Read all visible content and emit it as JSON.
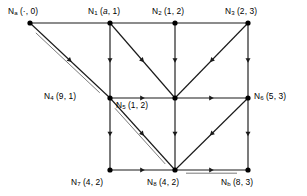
{
  "figure": {
    "type": "directed-graph",
    "background": "#ffffff",
    "stroke_color": "#1a1a1a",
    "node_color": "#000000",
    "width": 307,
    "height": 196
  },
  "nodes": [
    {
      "id": "Na",
      "name": "N",
      "sub": "a",
      "sub_italic": false,
      "tuple": "(·, 0)",
      "label": "Nₐ (·, 0)",
      "x": 30,
      "y": 23,
      "label_x": 8,
      "label_y": 7,
      "label_anchor": "above"
    },
    {
      "id": "N1",
      "name": "N",
      "sub": "1",
      "sub_italic": false,
      "tuple": "(a, 1)",
      "label": "N₁ (a, 1)",
      "x": 110,
      "y": 23,
      "label_x": 88,
      "label_y": 7,
      "label_anchor": "above"
    },
    {
      "id": "N2",
      "name": "N",
      "sub": "2",
      "sub_italic": false,
      "tuple": "(1, 2)",
      "label": "N₂ (1, 2)",
      "x": 175,
      "y": 23,
      "label_x": 153,
      "label_y": 7,
      "label_anchor": "above"
    },
    {
      "id": "N3",
      "name": "N",
      "sub": "3",
      "sub_italic": false,
      "tuple": "(2, 3)",
      "label": "N₃ (2, 3)",
      "x": 248,
      "y": 23,
      "label_x": 226,
      "label_y": 7,
      "label_anchor": "above"
    },
    {
      "id": "N4",
      "name": "N",
      "sub": "4",
      "sub_italic": false,
      "tuple": "(9, 1)",
      "label": "N₄ (9, 1)",
      "x": 110,
      "y": 98,
      "label_x": 44,
      "label_y": 92,
      "label_anchor": "left"
    },
    {
      "id": "N5",
      "name": "N",
      "sub": "5",
      "sub_italic": false,
      "tuple": "(1, 2)",
      "label": "N₅ (1, 2)",
      "x": 175,
      "y": 98,
      "label_x": 116,
      "label_y": 100,
      "label_anchor": "below-left"
    },
    {
      "id": "N6",
      "name": "N",
      "sub": "6",
      "sub_italic": false,
      "tuple": "(5, 3)",
      "label": "N₆ (5, 3)",
      "x": 248,
      "y": 98,
      "label_x": 254,
      "label_y": 92,
      "label_anchor": "right"
    },
    {
      "id": "N7",
      "name": "N",
      "sub": "7",
      "sub_italic": false,
      "tuple": "(4, 2)",
      "label": "N₇ (4, 2)",
      "x": 110,
      "y": 170,
      "label_x": 72,
      "label_y": 178,
      "label_anchor": "below"
    },
    {
      "id": "N8",
      "name": "N",
      "sub": "8",
      "sub_italic": false,
      "tuple": "(4, 2)",
      "label": "N₈ (4, 2)",
      "x": 175,
      "y": 170,
      "label_x": 148,
      "label_y": 178,
      "label_anchor": "below"
    },
    {
      "id": "Nb",
      "name": "N",
      "sub": "b",
      "sub_italic": false,
      "tuple": "(8, 3)",
      "label": "Nᵇ (8, 3)",
      "x": 248,
      "y": 170,
      "label_x": 222,
      "label_y": 178,
      "label_anchor": "below"
    }
  ],
  "edges": [
    {
      "id": "e-na-n1",
      "from": "Na",
      "to": "N1",
      "style": "single",
      "arrow": "none",
      "note": "top row segment Na to N1"
    },
    {
      "id": "e-n1-n2",
      "from": "N1",
      "to": "N2",
      "style": "single",
      "arrow": "none",
      "note": "top row segment N1 to N2"
    },
    {
      "id": "e-n2-n3",
      "from": "N2",
      "to": "N3",
      "style": "single",
      "arrow": "none",
      "note": "top row segment N2 to N3"
    },
    {
      "id": "e-na-n4",
      "from": "Na",
      "to": "N4",
      "style": "double",
      "arrow": "mid",
      "note": "doubled diagonal Na to N4"
    },
    {
      "id": "e-n1-n4",
      "from": "N1",
      "to": "N4",
      "style": "single",
      "arrow": "mid",
      "note": "vertical N1 down to N4"
    },
    {
      "id": "e-n1-n5",
      "from": "N1",
      "to": "N5",
      "style": "single",
      "arrow": "mid",
      "note": "diagonal N1 down-right to N5"
    },
    {
      "id": "e-n2-n5",
      "from": "N2",
      "to": "N5",
      "style": "single",
      "arrow": "mid",
      "note": "vertical N2 down to N5"
    },
    {
      "id": "e-n3-n5",
      "from": "N3",
      "to": "N5",
      "style": "single",
      "arrow": "mid",
      "note": "diagonal N3 down-left to N5"
    },
    {
      "id": "e-n3-n6",
      "from": "N3",
      "to": "N6",
      "style": "single",
      "arrow": "mid",
      "note": "vertical N3 down to N6"
    },
    {
      "id": "e-n4-n5",
      "from": "N4",
      "to": "N5",
      "style": "single",
      "arrow": "mid",
      "note": "horizontal N4 right to N5"
    },
    {
      "id": "e-n5-n6",
      "from": "N5",
      "to": "N6",
      "style": "single",
      "arrow": "mid",
      "note": "horizontal N5 right to N6"
    },
    {
      "id": "e-n4-n7",
      "from": "N4",
      "to": "N7",
      "style": "single",
      "arrow": "mid",
      "note": "vertical N4 down to N7"
    },
    {
      "id": "e-n4-n8",
      "from": "N4",
      "to": "N8",
      "style": "double",
      "arrow": "mid",
      "note": "doubled diagonal N4 to N8"
    },
    {
      "id": "e-n5-n8",
      "from": "N5",
      "to": "N8",
      "style": "single",
      "arrow": "mid",
      "note": "vertical N5 down to N8"
    },
    {
      "id": "e-n6-n8",
      "from": "N6",
      "to": "N8",
      "style": "single",
      "arrow": "mid",
      "note": "diagonal N6 down-left to N8"
    },
    {
      "id": "e-n6-nb",
      "from": "N6",
      "to": "Nb",
      "style": "single",
      "arrow": "mid",
      "note": "vertical N6 down to Nb"
    },
    {
      "id": "e-n7-n8",
      "from": "N7",
      "to": "N8",
      "style": "single",
      "arrow": "mid",
      "note": "horizontal N7 right to N8"
    },
    {
      "id": "e-n8-nb",
      "from": "N8",
      "to": "Nb",
      "style": "double",
      "arrow": "mid",
      "note": "doubled horizontal N8 right to Nb"
    }
  ]
}
